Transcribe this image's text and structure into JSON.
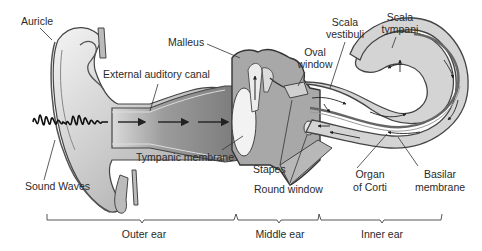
{
  "diagram": {
    "colors": {
      "background": "#ffffff",
      "outline": "#3a3a3a",
      "canal_fill": "#8c8c8c",
      "light_fill": "#d9d9d9",
      "text": "#2a2a2a"
    },
    "labels": {
      "auricle": "Auricle",
      "malleus": "Malleus",
      "external_auditory_canal": "External auditory canal",
      "oval_window_1": "Oval",
      "oval_window_2": "window",
      "scala_vestibuli_1": "Scala",
      "scala_vestibuli_2": "vestibuli",
      "scala_tympani_1": "Scala",
      "scala_tympani_2": "tympani",
      "tympanic_membrane": "Tympanic membrane",
      "sound_waves": "Sound Waves",
      "stapes": "Stapes",
      "round_window": "Round window",
      "organ_of_corti_1": "Organ",
      "organ_of_corti_2": "of Corti",
      "basilar_membrane_1": "Basilar",
      "basilar_membrane_2": "membrane"
    },
    "sections": [
      {
        "id": "outer",
        "label": "Outer ear"
      },
      {
        "id": "middle",
        "label": "Middle ear"
      },
      {
        "id": "inner",
        "label": "Inner ear"
      }
    ]
  }
}
